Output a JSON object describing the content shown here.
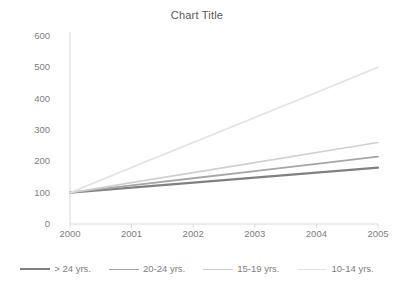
{
  "chart_data": {
    "type": "line",
    "title": "Chart Title",
    "xlabel": "",
    "ylabel": "",
    "x": [
      2000,
      2001,
      2002,
      2003,
      2004,
      2005
    ],
    "categories": [
      "2000",
      "2001",
      "2002",
      "2003",
      "2004",
      "2005"
    ],
    "yticks": [
      0,
      100,
      200,
      300,
      400,
      500,
      600
    ],
    "ytick_labels": [
      "0",
      "100",
      "200",
      "300",
      "400",
      "500",
      "600"
    ],
    "ylim": [
      0,
      600
    ],
    "grid": false,
    "legend_position": "bottom",
    "series": [
      {
        "name": "> 24 yrs.",
        "color": "#808080",
        "width": 2.2,
        "values": [
          100,
          116,
          132,
          148,
          164,
          180
        ]
      },
      {
        "name": "20-24 yrs.",
        "color": "#a6a6a6",
        "width": 1.8,
        "values": [
          100,
          123,
          146,
          169,
          192,
          215
        ]
      },
      {
        "name": "15-19 yrs.",
        "color": "#d0d0d0",
        "width": 1.6,
        "values": [
          100,
          132,
          164,
          196,
          228,
          260
        ]
      },
      {
        "name": "10-14 yrs.",
        "color": "#e2e2e2",
        "width": 1.6,
        "values": [
          100,
          180,
          260,
          340,
          420,
          500
        ]
      }
    ]
  },
  "axis": {
    "line_color": "#d9d9d9",
    "tick_color": "#d9d9d9"
  }
}
